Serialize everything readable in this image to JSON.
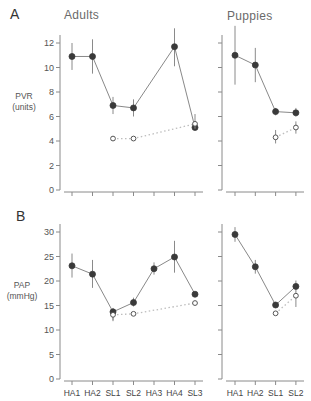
{
  "figure": {
    "panel_letters": [
      "A",
      "B"
    ],
    "group_titles": [
      "Adults",
      "Puppies"
    ]
  },
  "colors": {
    "axis": "#8a8a8a",
    "line": "#7a7a7a",
    "filled_marker": "#3a3a3a",
    "open_marker_stroke": "#555555",
    "dotted_line": "#bdbdbd",
    "error_bar": "#8a8a8a"
  },
  "chart_data": [
    {
      "type": "line",
      "panel": "A",
      "group": "Adults",
      "title": "Adults",
      "ylabel": "PVR (units)",
      "xlabel": "",
      "ylim": [
        0,
        12
      ],
      "yticks": [
        0,
        2,
        4,
        6,
        8,
        10,
        12
      ],
      "categories": [
        "HA1",
        "HA2",
        "SL1",
        "SL2",
        "HA3",
        "HA4",
        "SL3"
      ],
      "grid": false,
      "series": [
        {
          "name": "filled (solid line)",
          "marker": "filled",
          "values": [
            10.9,
            10.9,
            6.9,
            6.7,
            null,
            11.7,
            5.1
          ],
          "err_low": [
            9.8,
            9.5,
            6.2,
            6.0,
            null,
            10.1,
            4.9
          ],
          "err_high": [
            12.0,
            12.3,
            7.6,
            7.4,
            null,
            13.2,
            5.3
          ]
        },
        {
          "name": "open (dotted line)",
          "marker": "open",
          "values": [
            null,
            null,
            4.2,
            4.2,
            null,
            null,
            5.4
          ],
          "err_low": [
            null,
            null,
            4.2,
            4.2,
            null,
            null,
            5.0
          ],
          "err_high": [
            null,
            null,
            4.2,
            4.2,
            null,
            null,
            6.2
          ]
        }
      ]
    },
    {
      "type": "line",
      "panel": "A",
      "group": "Puppies",
      "title": "Puppies",
      "ylabel": "PVR (units)",
      "xlabel": "",
      "ylim": [
        0,
        12
      ],
      "yticks": [
        0,
        2,
        4,
        6,
        8,
        10,
        12
      ],
      "categories": [
        "HA1",
        "HA2",
        "SL1",
        "SL2"
      ],
      "grid": false,
      "series": [
        {
          "name": "filled (solid line)",
          "marker": "filled",
          "values": [
            11.0,
            10.2,
            6.4,
            6.3
          ],
          "err_low": [
            8.6,
            8.8,
            6.1,
            6.0
          ],
          "err_high": [
            13.4,
            11.6,
            6.7,
            6.7
          ]
        },
        {
          "name": "open (dotted line)",
          "marker": "open",
          "values": [
            null,
            null,
            4.3,
            5.1
          ],
          "err_low": [
            null,
            null,
            3.8,
            4.6
          ],
          "err_high": [
            null,
            null,
            4.9,
            5.6
          ]
        }
      ]
    },
    {
      "type": "line",
      "panel": "B",
      "group": "Adults",
      "title": "",
      "ylabel": "PAP (mmHg)",
      "xlabel": "",
      "ylim": [
        0,
        30
      ],
      "yticks": [
        0,
        5,
        10,
        15,
        20,
        25,
        30
      ],
      "categories": [
        "HA1",
        "HA2",
        "SL1",
        "SL2",
        "HA3",
        "HA4",
        "SL3"
      ],
      "grid": false,
      "series": [
        {
          "name": "filled (solid line)",
          "marker": "filled",
          "values": [
            23.1,
            21.4,
            13.7,
            15.6,
            22.5,
            24.9,
            17.3
          ],
          "err_low": [
            20.7,
            18.6,
            12.0,
            14.8,
            21.3,
            21.7,
            16.9
          ],
          "err_high": [
            25.6,
            24.3,
            14.5,
            16.6,
            23.8,
            28.2,
            17.7
          ]
        },
        {
          "name": "open (dotted line)",
          "marker": "open",
          "values": [
            null,
            null,
            13.1,
            13.3,
            null,
            null,
            15.5
          ],
          "err_low": [
            null,
            null,
            11.8,
            13.0,
            null,
            null,
            15.2
          ],
          "err_high": [
            null,
            null,
            13.4,
            13.6,
            null,
            null,
            15.8
          ]
        }
      ]
    },
    {
      "type": "line",
      "panel": "B",
      "group": "Puppies",
      "title": "",
      "ylabel": "PAP (mmHg)",
      "xlabel": "",
      "ylim": [
        0,
        30
      ],
      "yticks": [
        0,
        5,
        10,
        15,
        20,
        25,
        30
      ],
      "categories": [
        "HA1",
        "HA2",
        "SL1",
        "SL2"
      ],
      "grid": false,
      "series": [
        {
          "name": "filled (solid line)",
          "marker": "filled",
          "values": [
            29.5,
            22.9,
            15.1,
            18.9
          ],
          "err_low": [
            28.0,
            21.5,
            14.6,
            17.9
          ],
          "err_high": [
            31.0,
            24.3,
            15.6,
            20.1
          ]
        },
        {
          "name": "open (dotted line)",
          "marker": "open",
          "values": [
            null,
            null,
            13.4,
            17.0
          ],
          "err_low": [
            null,
            null,
            13.1,
            14.7
          ],
          "err_high": [
            null,
            null,
            13.7,
            18.0
          ]
        }
      ]
    }
  ],
  "ylabels": {
    "A": [
      "PVR",
      "(units)"
    ],
    "B": [
      "PAP",
      "(mmHg)"
    ]
  }
}
